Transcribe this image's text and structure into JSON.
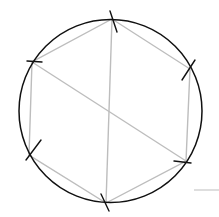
{
  "diagram": {
    "colors": {
      "circle": "#111111",
      "polygon": "#bdbdbd",
      "ticks": "#111111",
      "stray_line": "#c8c8c8"
    },
    "circle": {
      "cx": 110.5,
      "cy": 111,
      "r": 91.5
    },
    "vertices": [
      {
        "name": "top",
        "x": 112,
        "y": 19
      },
      {
        "name": "upper-right",
        "x": 190,
        "y": 69
      },
      {
        "name": "lower-right",
        "x": 186,
        "y": 161
      },
      {
        "name": "bottom",
        "x": 106,
        "y": 203
      },
      {
        "name": "lower-left",
        "x": 29,
        "y": 155
      },
      {
        "name": "upper-left",
        "x": 32,
        "y": 62
      }
    ],
    "diagonals": [
      {
        "from": "top",
        "to": "bottom"
      },
      {
        "from": "upper-left",
        "to": "lower-right"
      }
    ]
  }
}
